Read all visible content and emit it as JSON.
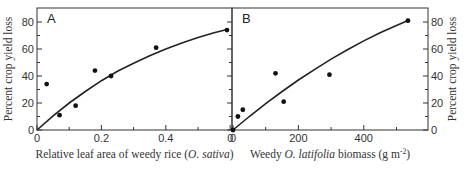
{
  "chart_data": [
    {
      "panel": "A",
      "type": "scatter",
      "title": "",
      "panel_label": "A",
      "xlabel": "Relative leaf area of weedy rice (O. sativa)",
      "xlabel_parts": [
        "Relative leaf area of weedy rice (",
        "O. sativa",
        ")"
      ],
      "ylabel": "Percent crop yield loss",
      "xlim": [
        0,
        0.6
      ],
      "ylim": [
        0,
        90
      ],
      "xticks": [
        0,
        0.2,
        0.4,
        0.6
      ],
      "xtick_labels": [
        "0",
        "0.2",
        "0.4",
        "0"
      ],
      "x_minor_ticks": [
        0.1,
        0.3,
        0.5
      ],
      "yticks": [
        0,
        20,
        40,
        60,
        80
      ],
      "ytick_labels": [
        "0",
        "20",
        "40",
        "60",
        "80"
      ],
      "y_minor_ticks": [
        10,
        30,
        50,
        70
      ],
      "grid": false,
      "series": [
        {
          "name": "observed",
          "kind": "points",
          "x": [
            0.03,
            0.07,
            0.12,
            0.18,
            0.23,
            0.37,
            0.59
          ],
          "y": [
            34,
            11,
            18,
            44,
            40,
            61,
            74
          ]
        },
        {
          "name": "fitted curve",
          "kind": "line",
          "x": [
            0,
            0.05,
            0.1,
            0.15,
            0.2,
            0.25,
            0.3,
            0.35,
            0.4,
            0.45,
            0.5,
            0.55,
            0.59
          ],
          "y": [
            0,
            10.5,
            20,
            28.5,
            36.5,
            43.5,
            49.5,
            55,
            60,
            64.5,
            68.5,
            72,
            74.5
          ]
        }
      ]
    },
    {
      "panel": "B",
      "type": "scatter",
      "title": "",
      "panel_label": "B",
      "xlabel": "Weedy O. latifolia biomass (g m-2)",
      "xlabel_parts": [
        "Weedy ",
        "O. latifolia",
        " biomass (g m",
        "-2",
        ")"
      ],
      "ylabel": "Percent crop yield loss",
      "xlim": [
        0,
        600
      ],
      "ylim": [
        0,
        90
      ],
      "xticks": [
        0,
        200,
        400
      ],
      "xtick_labels": [
        "0",
        "200",
        "400"
      ],
      "x_minor_ticks": [
        100,
        300,
        500
      ],
      "yticks": [
        0,
        20,
        40,
        60,
        80
      ],
      "ytick_labels": [
        "0",
        "20",
        "40",
        "60",
        "80"
      ],
      "y_minor_ticks": [
        10,
        30,
        50,
        70
      ],
      "grid": false,
      "series": [
        {
          "name": "observed",
          "kind": "points",
          "x": [
            0,
            15,
            30,
            130,
            155,
            295,
            535
          ],
          "y": [
            0,
            10,
            15,
            42,
            21,
            41,
            81
          ]
        },
        {
          "name": "fitted curve",
          "kind": "line",
          "x": [
            0,
            50,
            100,
            150,
            200,
            250,
            300,
            350,
            400,
            450,
            500,
            535
          ],
          "y": [
            0,
            10,
            19.5,
            28.5,
            37,
            45,
            52.5,
            59.5,
            66,
            72,
            77.5,
            81
          ]
        }
      ]
    }
  ]
}
